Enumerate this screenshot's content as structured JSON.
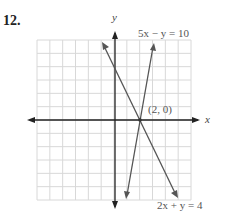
{
  "problem_number": "12.",
  "labels": {
    "y_axis": "y",
    "x_axis": "x",
    "line1": "5x − y = 10",
    "line2": "2x + y = 4",
    "point": "(2, 0)"
  },
  "colors": {
    "grid": "#d8d8d8",
    "axis": "#222222",
    "line": "#555555"
  },
  "chart_data": {
    "type": "line",
    "title": "",
    "xlabel": "x",
    "ylabel": "y",
    "xlim": [
      -6,
      6
    ],
    "ylim": [
      -6,
      6
    ],
    "grid": true,
    "series": [
      {
        "name": "5x − y = 10",
        "x": [
          0.9,
          3.0
        ],
        "y": [
          -5.5,
          5
        ]
      },
      {
        "name": "2x + y = 4",
        "x": [
          -1.0,
          4.9
        ],
        "y": [
          5.5,
          -5.8
        ]
      }
    ],
    "annotations": [
      {
        "text": "(2, 0)",
        "x": 2,
        "y": 0
      }
    ]
  }
}
